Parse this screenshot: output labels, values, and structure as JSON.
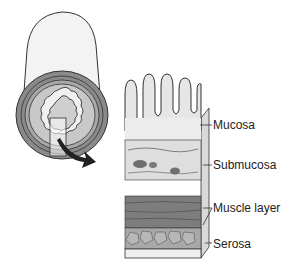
{
  "diagram": {
    "tube_cross_section": {
      "has_highlight_box": true,
      "arrow_direction": "down-right"
    },
    "labels": [
      {
        "id": "mucosa",
        "text": "Mucosa",
        "x": 213,
        "y": 118
      },
      {
        "id": "submucosa",
        "text": "Submucosa",
        "x": 213,
        "y": 158
      },
      {
        "id": "muscle",
        "text": "Muscle layer",
        "x": 213,
        "y": 201
      },
      {
        "id": "serosa",
        "text": "Serosa",
        "x": 213,
        "y": 237
      }
    ],
    "colors": {
      "outline": "#333333",
      "tube_outer": "#f2f2f2",
      "ring_dark": "#8a8a8a",
      "ring_mid": "#b5b5b5",
      "ring_light": "#d6d6d6",
      "mucosa_fill": "#e8e8e8",
      "submucosa_fill": "#dcdcdc",
      "muscle_fill": "#7d7d7d",
      "serosa_fill": "#a8a8a8"
    }
  }
}
